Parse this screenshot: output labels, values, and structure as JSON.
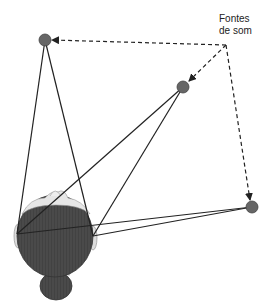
{
  "label": {
    "line1": "Fontes",
    "line2": "de som"
  },
  "colors": {
    "source_fill": "#666666",
    "line": "#222222",
    "head_fill": "#4a4a4a",
    "hair_light": "#d8d8d8"
  },
  "sources": [
    {
      "name": "source-top-left",
      "x": 45,
      "y": 40
    },
    {
      "name": "source-middle-right",
      "x": 183,
      "y": 87
    },
    {
      "name": "source-bottom-right",
      "x": 252,
      "y": 207
    }
  ],
  "ears": {
    "left": {
      "x": 17,
      "y": 234
    },
    "right": {
      "x": 93,
      "y": 236
    }
  },
  "arrow_origin": {
    "x": 226,
    "y": 45
  }
}
